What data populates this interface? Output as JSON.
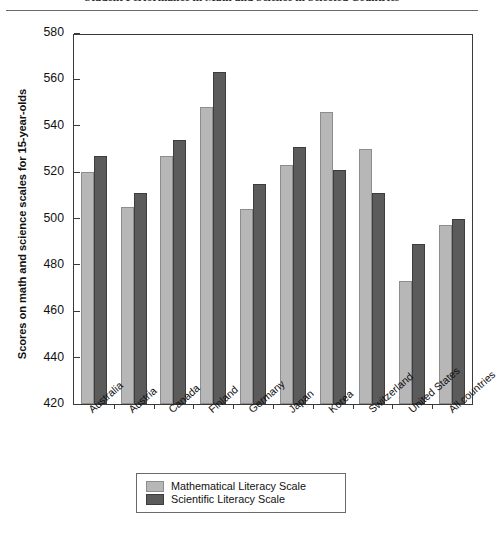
{
  "title": {
    "text": "Student Performance in Math and Science in Selected Countries",
    "clipped": true
  },
  "legend": {
    "position": "bottom-center",
    "entries": [
      {
        "label": "Mathematical Literacy Scale",
        "color": "#b7b7b7",
        "icon": "legend-swatch-math"
      },
      {
        "label": "Scientific Literacy Scale",
        "color": "#5b5b5b",
        "icon": "legend-swatch-science"
      }
    ]
  },
  "chart_data": {
    "type": "bar",
    "title": "Student Performance in Math and Science in Selected Countries",
    "xlabel": "",
    "ylabel": "Scores on math and science scales for 15-year-olds",
    "ylim": [
      420,
      580
    ],
    "yticks": [
      420,
      440,
      460,
      480,
      500,
      520,
      540,
      560,
      580
    ],
    "ytick_labels": [
      "420",
      "440",
      "460",
      "480",
      "500",
      "520",
      "540",
      "560",
      "580"
    ],
    "grid": false,
    "legend_position": "bottom-center",
    "categories": [
      "Australia",
      "Austria",
      "Canada",
      "Finland",
      "Germany",
      "Japan",
      "Korea",
      "Switzerland",
      "United States",
      "All countries"
    ],
    "series": [
      {
        "name": "Mathematical Literacy Scale",
        "color": "#b7b7b7",
        "values": [
          520,
          505,
          527,
          548,
          504,
          523,
          546,
          530,
          473,
          497
        ]
      },
      {
        "name": "Scientific Literacy Scale",
        "color": "#5b5b5b",
        "values": [
          527,
          511,
          534,
          563,
          515,
          531,
          521,
          511,
          489,
          500
        ]
      }
    ]
  }
}
